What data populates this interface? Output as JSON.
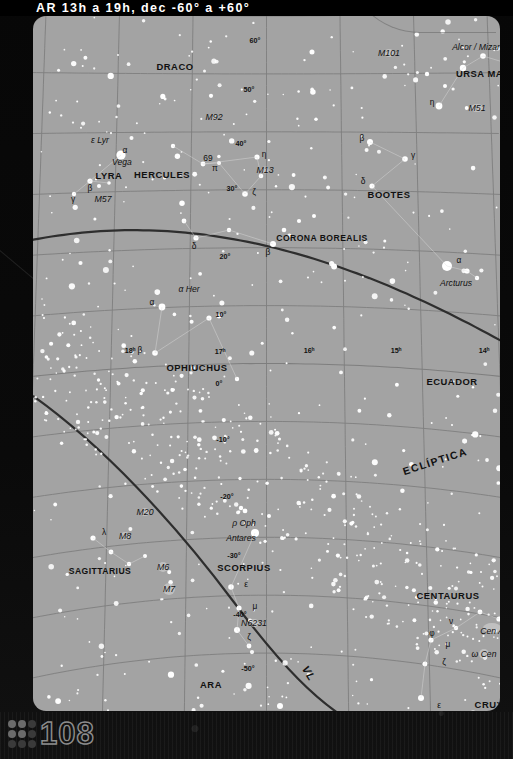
{
  "header": {
    "title": "AR 13h a 19h, dec -60° a +60°"
  },
  "page": {
    "number": "108"
  },
  "chart_data": {
    "type": "scatter",
    "title": "AR 13h a 19h, dec -60° a +60°",
    "xlabel": "AR",
    "ylabel": "dec",
    "xlim": [
      13,
      19
    ],
    "ylim": [
      -60,
      60
    ],
    "grid": true,
    "projection": "curved sky chart",
    "background_color": "#a3a3a3",
    "star_color": "#ffffff",
    "grid_color": "#7e7e7e",
    "ra_ticks": [
      {
        "label": "18ʰ",
        "value": 18,
        "x": 97,
        "y": 334
      },
      {
        "label": "17ʰ",
        "value": 17,
        "x": 187,
        "y": 335
      },
      {
        "label": "16ʰ",
        "value": 16,
        "x": 276,
        "y": 334
      },
      {
        "label": "15ʰ",
        "value": 15,
        "x": 363,
        "y": 334
      },
      {
        "label": "14ʰ",
        "value": 14,
        "x": 451,
        "y": 334
      }
    ],
    "dec_ticks": [
      {
        "label": "60°",
        "value": 60,
        "x": 222,
        "y": 24
      },
      {
        "label": "50°",
        "value": 50,
        "x": 216,
        "y": 73
      },
      {
        "label": "40°",
        "value": 40,
        "x": 208,
        "y": 127
      },
      {
        "label": "30°",
        "value": 30,
        "x": 199,
        "y": 172
      },
      {
        "label": "20°",
        "value": 20,
        "x": 192,
        "y": 240
      },
      {
        "label": "10°",
        "value": 10,
        "x": 188,
        "y": 298
      },
      {
        "label": "0°",
        "value": 0,
        "x": 186,
        "y": 367
      },
      {
        "label": "-10°",
        "value": -10,
        "x": 190,
        "y": 423
      },
      {
        "label": "-20°",
        "value": -20,
        "x": 194,
        "y": 480
      },
      {
        "label": "-30°",
        "value": -30,
        "x": 201,
        "y": 539
      },
      {
        "label": "-40°",
        "value": -40,
        "x": 207,
        "y": 598
      },
      {
        "label": "-50°",
        "value": -50,
        "x": 215,
        "y": 652
      },
      {
        "label": "-60°",
        "value": -60,
        "x": 227,
        "y": 702
      }
    ],
    "constellations": [
      {
        "name": "DRACO",
        "x": 142,
        "y": 50
      },
      {
        "name": "URSA MAJOR",
        "x": 457,
        "y": 57
      },
      {
        "name": "LYRA",
        "x": 76,
        "y": 159
      },
      {
        "name": "HERCULES",
        "x": 129,
        "y": 158
      },
      {
        "name": "BOOTES",
        "x": 356,
        "y": 178
      },
      {
        "name": "CORONA BOREALIS",
        "x": 289,
        "y": 222
      },
      {
        "name": "OPHIUCHUS",
        "x": 164,
        "y": 351
      },
      {
        "name": "ECUADOR",
        "x": 419,
        "y": 365
      },
      {
        "name": "SAGITTARIUS",
        "x": 67,
        "y": 555
      },
      {
        "name": "SCORPIUS",
        "x": 211,
        "y": 551
      },
      {
        "name": "CENTAURUS",
        "x": 415,
        "y": 579
      },
      {
        "name": "ARA",
        "x": 178,
        "y": 668
      },
      {
        "name": "CRUX",
        "x": 456,
        "y": 688
      }
    ],
    "named_stars": [
      {
        "name": "Vega",
        "x": 89,
        "y": 146
      },
      {
        "name": "Arcturus",
        "x": 423,
        "y": 267
      },
      {
        "name": "Spica",
        "x": 488,
        "y": 447
      },
      {
        "name": "Antares",
        "x": 208,
        "y": 522
      },
      {
        "name": "Alcor / Mizar",
        "x": 443,
        "y": 31
      },
      {
        "name": "α Her",
        "x": 156,
        "y": 273
      },
      {
        "name": "ρ Oph",
        "x": 211,
        "y": 507
      },
      {
        "name": "ε Lyr",
        "x": 67,
        "y": 124
      },
      {
        "name": "Cen A",
        "x": 459,
        "y": 615
      },
      {
        "name": "ω Cen",
        "x": 451,
        "y": 638
      }
    ],
    "deep_sky_objects": [
      {
        "name": "M101",
        "x": 356,
        "y": 37
      },
      {
        "name": "M51",
        "x": 444,
        "y": 92
      },
      {
        "name": "M92",
        "x": 181,
        "y": 101
      },
      {
        "name": "M13",
        "x": 232,
        "y": 154
      },
      {
        "name": "M57",
        "x": 70,
        "y": 183
      },
      {
        "name": "M20",
        "x": 112,
        "y": 496
      },
      {
        "name": "M8",
        "x": 92,
        "y": 520
      },
      {
        "name": "M6",
        "x": 130,
        "y": 551
      },
      {
        "name": "M7",
        "x": 136,
        "y": 573
      },
      {
        "name": "N6231",
        "x": 221,
        "y": 607
      }
    ],
    "greek_labels": [
      {
        "name": "α",
        "x": 92,
        "y": 134
      },
      {
        "name": "β",
        "x": 57,
        "y": 172
      },
      {
        "name": "γ",
        "x": 40,
        "y": 183
      },
      {
        "name": "69",
        "x": 175,
        "y": 142
      },
      {
        "name": "π",
        "x": 182,
        "y": 152
      },
      {
        "name": "η",
        "x": 231,
        "y": 138
      },
      {
        "name": "ζ",
        "x": 221,
        "y": 176
      },
      {
        "name": "β",
        "x": 329,
        "y": 122
      },
      {
        "name": "γ",
        "x": 380,
        "y": 139
      },
      {
        "name": "δ",
        "x": 330,
        "y": 165
      },
      {
        "name": "η",
        "x": 399,
        "y": 86
      },
      {
        "name": "δ",
        "x": 161,
        "y": 230
      },
      {
        "name": "β",
        "x": 235,
        "y": 236
      },
      {
        "name": "α",
        "x": 426,
        "y": 244
      },
      {
        "name": "α",
        "x": 119,
        "y": 286
      },
      {
        "name": "β",
        "x": 107,
        "y": 334
      },
      {
        "name": "λ",
        "x": 71,
        "y": 516
      },
      {
        "name": "ε",
        "x": 213,
        "y": 568
      },
      {
        "name": "μ",
        "x": 222,
        "y": 590
      },
      {
        "name": "ζ",
        "x": 216,
        "y": 621
      },
      {
        "name": "φ",
        "x": 399,
        "y": 617
      },
      {
        "name": "ν",
        "x": 418,
        "y": 605
      },
      {
        "name": "μ",
        "x": 415,
        "y": 628
      },
      {
        "name": "ζ",
        "x": 411,
        "y": 646
      },
      {
        "name": "ε",
        "x": 406,
        "y": 689
      },
      {
        "name": "α",
        "x": 333,
        "y": 707
      },
      {
        "name": "β",
        "x": 362,
        "y": 703
      }
    ],
    "lines": [
      {
        "name": "ECLÍPTICA",
        "label": "ECLÍPTICA",
        "x": 402,
        "y": 445,
        "rotation": -18
      },
      {
        "name": "VL",
        "label": "VL",
        "x": 276,
        "y": 657,
        "rotation": 58
      }
    ]
  }
}
